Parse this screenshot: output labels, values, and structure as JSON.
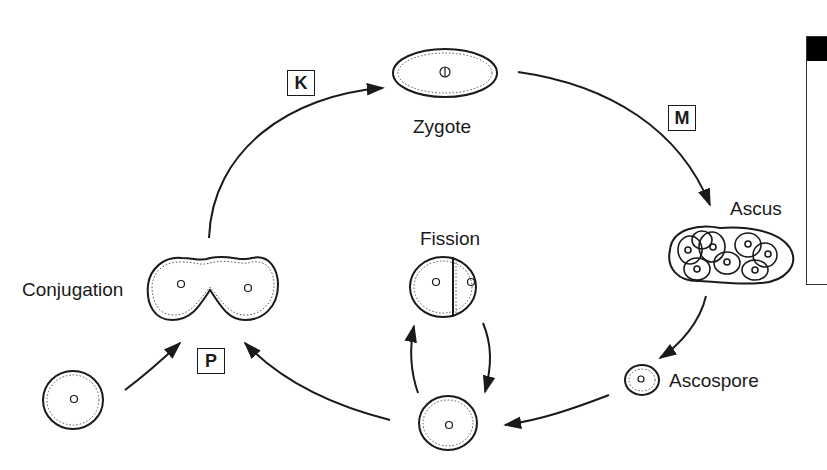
{
  "diagram": {
    "type": "life-cycle",
    "stages": {
      "zygote": "Zygote",
      "ascus": "Ascus",
      "ascospore": "Ascospore",
      "fission": "Fission",
      "conjugation": "Conjugation"
    },
    "step_labels": {
      "k": "K",
      "m": "M",
      "p": "P"
    },
    "edges": [
      {
        "from": "conjugation",
        "to": "zygote",
        "label": "K"
      },
      {
        "from": "zygote",
        "to": "ascus",
        "label": "M"
      },
      {
        "from": "ascus",
        "to": "ascospore"
      },
      {
        "from": "ascospore",
        "to": "vegetative-cell"
      },
      {
        "from": "vegetative-cell",
        "to": "fission"
      },
      {
        "from": "fission",
        "to": "vegetative-cell"
      },
      {
        "from": "vegetative-cell",
        "to": "conjugation",
        "label": "P"
      },
      {
        "from": "haploid-cell",
        "to": "conjugation"
      }
    ],
    "colors": {
      "line": "#1a1a1a",
      "background": "#ffffff"
    }
  }
}
